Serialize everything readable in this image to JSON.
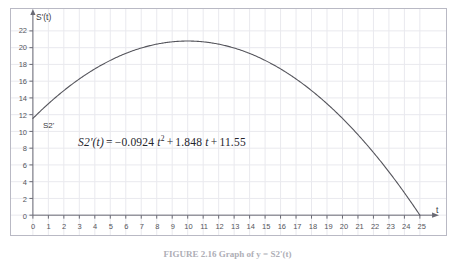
{
  "figure": {
    "caption": "FIGURE 2.16  Graph of  y = S2'(t)",
    "background_color": "#ffffff",
    "frame_color": "#b9b9c4",
    "grid_color": "#e9e9ee",
    "curve_color": "#55555c",
    "axis_color": "#6a6a74"
  },
  "axes": {
    "y_axis_name": "S'(t)",
    "x_axis_name": "t",
    "x_ticks": [
      0,
      1,
      2,
      3,
      4,
      5,
      6,
      7,
      8,
      9,
      10,
      11,
      12,
      13,
      14,
      15,
      16,
      17,
      18,
      19,
      20,
      21,
      22,
      23,
      24,
      25
    ],
    "y_ticks": [
      0,
      2,
      4,
      6,
      8,
      10,
      12,
      14,
      16,
      18,
      20,
      22
    ]
  },
  "annotations": {
    "curve_label": "S2'",
    "equation": {
      "lhs": "S2'(t)",
      "equals": "=",
      "coef_quadratic": "−0.0924",
      "term_quadratic_var": "t",
      "term_quadratic_exp": "2",
      "plus_1": "+",
      "coef_linear": "1.848",
      "term_linear_var": "t",
      "plus_2": "+",
      "constant": "11.55"
    }
  },
  "chart_data": {
    "type": "line",
    "title": "",
    "xlabel": "t",
    "ylabel": "S'(t)",
    "xlim": [
      0,
      25
    ],
    "ylim": [
      0,
      23
    ],
    "grid": true,
    "legend": "none",
    "equation": "S2'(t) = -0.0924 t^2 + 1.848 t + 11.55",
    "coefficients": {
      "a": -0.0924,
      "b": 1.848,
      "c": 11.55
    },
    "vertex": {
      "t": 10.0,
      "value": 20.79
    },
    "y_intercept": 11.55,
    "x_intercept": 25.0,
    "series": [
      {
        "name": "S2'",
        "x": [
          0,
          1,
          2,
          3,
          4,
          5,
          6,
          7,
          8,
          9,
          10,
          11,
          12,
          13,
          14,
          15,
          16,
          17,
          18,
          19,
          20,
          21,
          22,
          23,
          24,
          25
        ],
        "values": [
          11.55,
          13.31,
          14.88,
          16.26,
          17.46,
          18.48,
          19.31,
          19.95,
          20.41,
          20.69,
          20.79,
          20.69,
          20.41,
          19.95,
          19.31,
          18.48,
          17.46,
          16.26,
          14.88,
          13.31,
          11.55,
          9.61,
          7.48,
          5.17,
          2.67,
          0.0
        ]
      }
    ]
  }
}
